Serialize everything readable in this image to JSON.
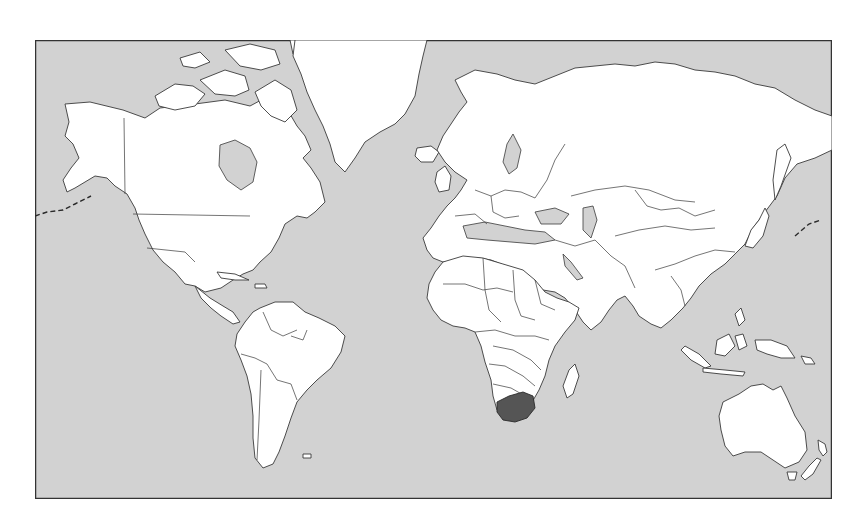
{
  "map": {
    "projection": "Mercator",
    "type": "world political outline map",
    "highlighted_country": "South Africa",
    "colors": {
      "ocean": "#d2d2d2",
      "land": "#ffffff",
      "outline": "#3a3a3a",
      "highlight": "#555555",
      "frame": "#333333",
      "page_background": "#ffffff"
    },
    "regions": [
      {
        "name": "North America",
        "highlighted": false
      },
      {
        "name": "Greenland",
        "highlighted": false
      },
      {
        "name": "South America",
        "highlighted": false
      },
      {
        "name": "Europe",
        "highlighted": false
      },
      {
        "name": "Africa",
        "highlighted": false
      },
      {
        "name": "Asia",
        "highlighted": false
      },
      {
        "name": "Australia",
        "highlighted": false
      },
      {
        "name": "New Zealand",
        "highlighted": false
      },
      {
        "name": "South Africa",
        "highlighted": true
      }
    ]
  }
}
